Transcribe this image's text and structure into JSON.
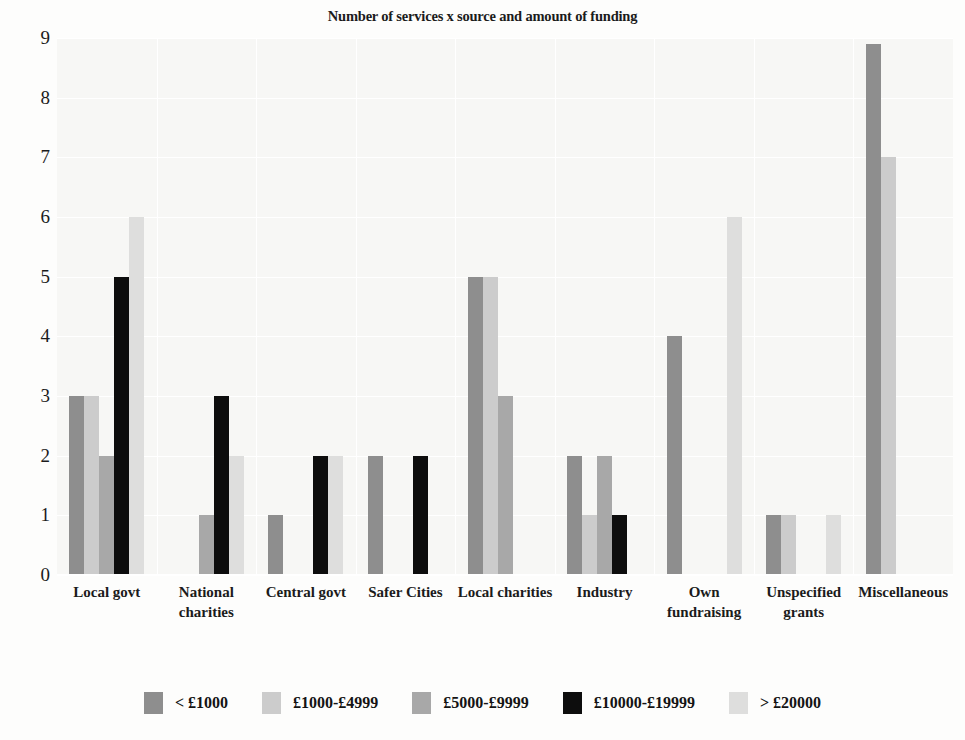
{
  "chart_data": {
    "type": "bar",
    "title": "Number of services x source and amount of funding",
    "xlabel": "",
    "ylabel": "",
    "ylim": [
      0,
      9
    ],
    "yticks": [
      "0",
      "1",
      "2",
      "3",
      "4",
      "5",
      "6",
      "7",
      "8",
      "9"
    ],
    "grid": true,
    "legend_position": "bottom",
    "categories": [
      "Local govt",
      "National charities",
      "Central govt",
      "Safer Cities",
      "Local charities",
      "Industry",
      "Own fundraising",
      "Unspecified grants",
      "Miscellaneous"
    ],
    "series": [
      {
        "name": "< £1000",
        "color": "#8e8e8e",
        "values": [
          3,
          0,
          1,
          2,
          5,
          2,
          4,
          1,
          8.9
        ]
      },
      {
        "name": "£1000-£4999",
        "color": "#cccccc",
        "values": [
          3,
          0,
          0,
          0,
          5,
          1,
          0,
          1,
          7
        ]
      },
      {
        "name": "£5000-£9999",
        "color": "#a8a8a8",
        "values": [
          2,
          1,
          0,
          0,
          3,
          2,
          0,
          0,
          0
        ]
      },
      {
        "name": "£10000-£19999",
        "color": "#0d0d0d",
        "values": [
          5,
          3,
          2,
          2,
          0,
          1,
          0,
          0,
          0
        ]
      },
      {
        "name": "> £20000",
        "color": "#dededd",
        "values": [
          6,
          2,
          2,
          0,
          0,
          0,
          6,
          1,
          0
        ]
      }
    ]
  },
  "style": {
    "plot_background": "#f7f7f5",
    "page_background": "#fdfdfc",
    "gridline_color": "#ffffff",
    "text_color": "#1b1b1b"
  }
}
